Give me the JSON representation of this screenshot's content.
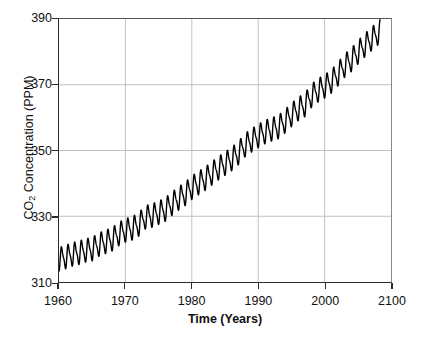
{
  "chart_data": {
    "type": "line",
    "title": "",
    "xlabel": "Time (Years)",
    "ylabel": "CO2 Concentration (PPM)",
    "ylabel_parts": {
      "prefix": "CO",
      "sub": "2",
      "suffix": " Concentration (PPM)"
    },
    "xlim": [
      1960,
      2010
    ],
    "ylim": [
      310,
      390
    ],
    "xticks": [
      1960,
      1970,
      1980,
      1990,
      2000,
      2010
    ],
    "xtick_labels": [
      "1960",
      "1970",
      "1980",
      "1990",
      "2000",
      "2100"
    ],
    "yticks": [
      310,
      330,
      350,
      370,
      390
    ],
    "ytick_labels": [
      "310",
      "330",
      "350",
      "370",
      "390"
    ],
    "grid": true,
    "grid_color": "#b9b9b9",
    "legend": "none",
    "line_color": "#000000",
    "line_width": 1.4,
    "series": [
      {
        "name": "Monthly mean CO2 (Mauna Loa)",
        "description": "Rising trend with annual seasonal sawtooth oscillation of about +/- 3 PPM",
        "seasonal_amplitude_ppm": 3.1,
        "x": [
          1960,
          1961,
          1962,
          1963,
          1964,
          1965,
          1966,
          1967,
          1968,
          1969,
          1970,
          1971,
          1972,
          1973,
          1974,
          1975,
          1976,
          1977,
          1978,
          1979,
          1980,
          1981,
          1982,
          1983,
          1984,
          1985,
          1986,
          1987,
          1988,
          1989,
          1990,
          1991,
          1992,
          1993,
          1994,
          1995,
          1996,
          1997,
          1998,
          1999,
          2000,
          2001,
          2002,
          2003,
          2004,
          2005,
          2006,
          2007,
          2008
        ],
        "values": [
          316.9,
          317.6,
          318.4,
          318.9,
          319.6,
          320.0,
          321.4,
          322.2,
          323.0,
          324.6,
          325.7,
          326.3,
          327.5,
          329.7,
          330.2,
          331.1,
          332.0,
          333.8,
          335.4,
          336.8,
          338.7,
          340.1,
          341.4,
          343.0,
          344.6,
          346.0,
          347.4,
          349.2,
          351.6,
          353.1,
          354.4,
          355.6,
          356.4,
          357.1,
          358.8,
          360.8,
          362.6,
          363.8,
          366.6,
          368.3,
          369.5,
          371.0,
          373.2,
          375.8,
          377.5,
          379.8,
          381.9,
          383.8,
          385.6
        ]
      }
    ]
  }
}
